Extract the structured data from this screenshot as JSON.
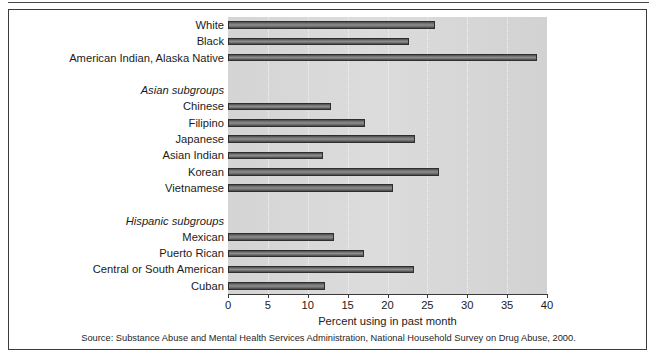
{
  "figure": {
    "source_note": "Source: Substance Abuse and Mental Health Services Administration, National Household Survey on Drug Abuse, 2000."
  },
  "chart_data": {
    "type": "bar",
    "orientation": "horizontal",
    "title": "",
    "xlabel": "Percent using in past month",
    "ylabel": "",
    "xlim": [
      0,
      40
    ],
    "xticks": [
      0,
      5,
      10,
      15,
      20,
      25,
      30,
      35,
      40
    ],
    "xticklabels": [
      "0",
      "5",
      "10",
      "15",
      "20",
      "25",
      "30",
      "35",
      "40"
    ],
    "grid": true,
    "legend": null,
    "bar_color": "#6b6b6b",
    "plot_background": "#d7d7d7",
    "rows": [
      {
        "label": "White",
        "value": 26.0,
        "kind": "bar"
      },
      {
        "label": "Black",
        "value": 22.7,
        "kind": "bar"
      },
      {
        "label": "American Indian, Alaska Native",
        "value": 38.8,
        "kind": "bar"
      },
      {
        "label": "",
        "value": null,
        "kind": "spacer"
      },
      {
        "label": "Asian subgroups",
        "value": null,
        "kind": "group"
      },
      {
        "label": "Chinese",
        "value": 12.9,
        "kind": "bar"
      },
      {
        "label": "Filipino",
        "value": 17.2,
        "kind": "bar"
      },
      {
        "label": "Japanese",
        "value": 23.4,
        "kind": "bar"
      },
      {
        "label": "Asian Indian",
        "value": 11.9,
        "kind": "bar"
      },
      {
        "label": "Korean",
        "value": 26.4,
        "kind": "bar"
      },
      {
        "label": "Vietnamese",
        "value": 20.7,
        "kind": "bar"
      },
      {
        "label": "",
        "value": null,
        "kind": "spacer"
      },
      {
        "label": "Hispanic subgroups",
        "value": null,
        "kind": "group"
      },
      {
        "label": "Mexican",
        "value": 13.3,
        "kind": "bar"
      },
      {
        "label": "Puerto Rican",
        "value": 17.0,
        "kind": "bar"
      },
      {
        "label": "Central or South American",
        "value": 23.3,
        "kind": "bar"
      },
      {
        "label": "Cuban",
        "value": 12.2,
        "kind": "bar"
      }
    ],
    "categories": [
      "White",
      "Black",
      "American Indian, Alaska Native",
      "Chinese",
      "Filipino",
      "Japanese",
      "Asian Indian",
      "Korean",
      "Vietnamese",
      "Mexican",
      "Puerto Rican",
      "Central or South American",
      "Cuban"
    ],
    "values": [
      26.0,
      22.7,
      38.8,
      12.9,
      17.2,
      23.4,
      11.9,
      26.4,
      20.7,
      13.3,
      17.0,
      23.3,
      12.2
    ]
  }
}
